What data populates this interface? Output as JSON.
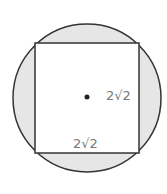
{
  "diagram": {
    "circle": {
      "cx": 87,
      "cy": 98,
      "r": 74,
      "fill": "#e6e6e6",
      "stroke": "#333333"
    },
    "square": {
      "x": 35,
      "y": 43,
      "width": 104,
      "height": 110,
      "fill": "#ffffff",
      "stroke": "#333333"
    },
    "center_dot": {
      "cx": 87,
      "cy": 97
    },
    "labels": {
      "right_side": "2√2",
      "bottom_side": "2√2"
    }
  }
}
